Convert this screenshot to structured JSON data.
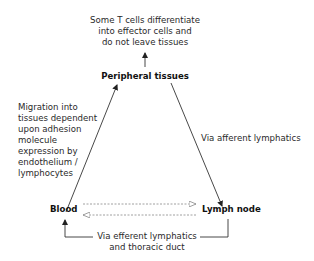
{
  "diagram": {
    "type": "flow-cycle",
    "nodes": {
      "peripheral_tissues": "Peripheral tissues",
      "blood": "Blood",
      "lymph_node": "Lymph node"
    },
    "annotations": {
      "top_note": [
        "Some T cells differentiate",
        "into effector cells and",
        "do not leave tissues"
      ],
      "blood_to_tissues": [
        "Migration into",
        "tissues dependent",
        "upon adhesion",
        "molecule",
        "expression by",
        "endothelium /",
        "lymphocytes"
      ],
      "tissues_to_node": "Via afferent lymphatics",
      "node_to_blood": [
        "Via efferent lymphatics",
        "and thoracic duct"
      ]
    },
    "edges": [
      {
        "from": "peripheral_tissues",
        "to": "top_note",
        "style": "solid"
      },
      {
        "from": "blood",
        "to": "peripheral_tissues",
        "style": "solid"
      },
      {
        "from": "peripheral_tissues",
        "to": "lymph_node",
        "style": "solid"
      },
      {
        "from": "blood",
        "to": "lymph_node",
        "style": "dashed"
      },
      {
        "from": "lymph_node",
        "to": "blood",
        "style": "dashed"
      },
      {
        "from": "lymph_node",
        "to": "blood",
        "style": "solid-elbow"
      }
    ],
    "colors": {
      "line": "#333333",
      "dashed": "#888888",
      "text": "#2a2a2a"
    }
  }
}
